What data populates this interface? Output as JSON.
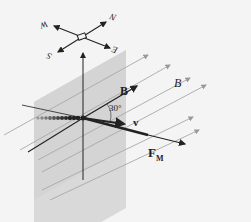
{
  "figure": {
    "compass": {
      "north": "N",
      "south": "S",
      "east": "E",
      "west": "W"
    },
    "labels": {
      "B_vector": "B",
      "B_field": "B",
      "angle": "30°",
      "velocity": "v",
      "force_main": "F",
      "force_sub": "M"
    },
    "colors": {
      "background": "#f4f4f4",
      "plane": "#d6d6d6",
      "field_line": "#a8a8a8",
      "ink": "#222222"
    }
  }
}
